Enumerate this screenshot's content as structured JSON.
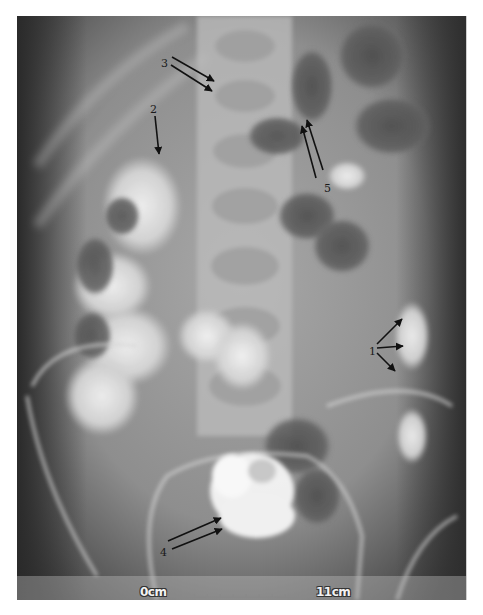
{
  "image": {
    "type": "abdominal radiograph (contrast study)",
    "colors": {
      "background": "#ffffff",
      "film_mid": "#8a8a8a",
      "contrast_bright": "#f4f4f4",
      "annotation": "#111111"
    }
  },
  "annotations": [
    {
      "label": "1",
      "arrow_count": 3
    },
    {
      "label": "2",
      "arrow_count": 1
    },
    {
      "label": "3",
      "arrow_count": 2
    },
    {
      "label": "4",
      "arrow_count": 2
    },
    {
      "label": "5",
      "arrow_count": 2
    }
  ],
  "scale_bar": {
    "start_label": "0cm",
    "end_label": "11cm"
  }
}
